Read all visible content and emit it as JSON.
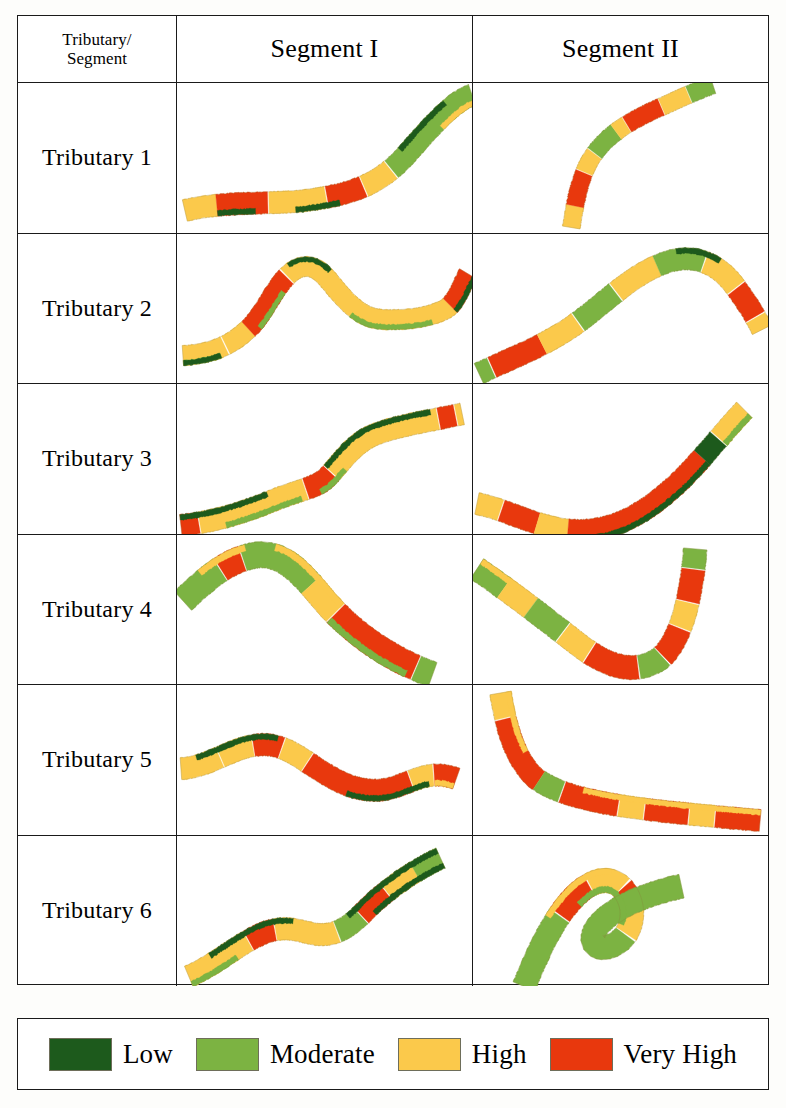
{
  "figure": {
    "type": "stream-condition-matrix",
    "header": {
      "corner_line1": "Tributary/",
      "corner_line2": "Segment",
      "col1": "Segment I",
      "col2": "Segment II"
    },
    "rows": [
      {
        "label": "Tributary 1"
      },
      {
        "label": "Tributary 2"
      },
      {
        "label": "Tributary 3"
      },
      {
        "label": "Tributary 4"
      },
      {
        "label": "Tributary 5"
      },
      {
        "label": "Tributary 6"
      }
    ],
    "legend": {
      "items": [
        {
          "label": "Low",
          "color": "#1d5a1c"
        },
        {
          "label": "Moderate",
          "color": "#7cb342"
        },
        {
          "label": "High",
          "color": "#fbc94b"
        },
        {
          "label": "Very High",
          "color": "#e8380d"
        }
      ]
    },
    "colors": {
      "low": "#1d5a1c",
      "moderate": "#7cb342",
      "high": "#fbc94b",
      "very_high": "#e8380d",
      "outline": "#1a1a1a",
      "paper": "#ffffff"
    }
  },
  "chart_data": {
    "type": "map",
    "title": "",
    "classes": [
      "Low",
      "Moderate",
      "High",
      "Very High"
    ],
    "class_colors": [
      "#1d5a1c",
      "#7cb342",
      "#fbc94b",
      "#e8380d"
    ],
    "rows": [
      "Tributary 1",
      "Tributary 2",
      "Tributary 3",
      "Tributary 4",
      "Tributary 5",
      "Tributary 6"
    ],
    "columns": [
      "Segment I",
      "Segment II"
    ],
    "cells": [
      {
        "row": "Tributary 1",
        "column": "Segment I",
        "path": "M 8 128 C 50 118 95 122 130 118 C 175 112 205 104 235 70 C 262 40 282 18 300 12",
        "width": 22,
        "bands": [
          {
            "start": 0.0,
            "end": 0.1,
            "color": "high"
          },
          {
            "start": 0.1,
            "end": 0.26,
            "color": "very_high"
          },
          {
            "start": 0.26,
            "end": 0.44,
            "color": "high"
          },
          {
            "start": 0.44,
            "end": 0.56,
            "color": "very_high"
          },
          {
            "start": 0.56,
            "end": 0.66,
            "color": "high"
          },
          {
            "start": 0.66,
            "end": 1.0,
            "color": "moderate"
          }
        ],
        "edge_bands": [
          {
            "start": 0.1,
            "end": 0.22,
            "color": "low",
            "side": "lower"
          },
          {
            "start": 0.34,
            "end": 0.48,
            "color": "low",
            "side": "lower"
          },
          {
            "start": 0.72,
            "end": 0.92,
            "color": "low",
            "side": "upper"
          },
          {
            "start": 0.86,
            "end": 1.0,
            "color": "high",
            "side": "lower"
          }
        ]
      },
      {
        "row": "Tributary 1",
        "column": "Segment II",
        "path": "M 100 145 C 104 120 108 96 120 76 C 138 48 168 34 196 22 C 218 12 232 6 244 2",
        "width": 18,
        "bands": [
          {
            "start": 0.0,
            "end": 0.1,
            "color": "high"
          },
          {
            "start": 0.1,
            "end": 0.26,
            "color": "very_high"
          },
          {
            "start": 0.26,
            "end": 0.36,
            "color": "high"
          },
          {
            "start": 0.36,
            "end": 0.5,
            "color": "moderate"
          },
          {
            "start": 0.5,
            "end": 0.56,
            "color": "high"
          },
          {
            "start": 0.56,
            "end": 0.74,
            "color": "very_high"
          },
          {
            "start": 0.74,
            "end": 0.88,
            "color": "high"
          },
          {
            "start": 0.88,
            "end": 1.0,
            "color": "moderate"
          }
        ],
        "edge_bands": []
      },
      {
        "row": "Tributary 2",
        "column": "Segment I",
        "path": "M 6 122 C 36 120 56 112 76 92 C 94 72 104 42 124 34 C 142 28 152 44 164 58 C 180 76 192 86 214 86 C 238 86 254 84 272 76 C 284 70 290 50 296 40",
        "width": 20,
        "bands": [
          {
            "start": 0.0,
            "end": 0.12,
            "color": "high"
          },
          {
            "start": 0.12,
            "end": 0.2,
            "color": "high"
          },
          {
            "start": 0.2,
            "end": 0.38,
            "color": "very_high"
          },
          {
            "start": 0.38,
            "end": 0.9,
            "color": "high"
          },
          {
            "start": 0.9,
            "end": 1.0,
            "color": "very_high"
          }
        ],
        "edge_bands": [
          {
            "start": 0.0,
            "end": 0.1,
            "color": "moderate",
            "side": "lower"
          },
          {
            "start": 0.0,
            "end": 0.1,
            "color": "low",
            "side": "lower"
          },
          {
            "start": 0.22,
            "end": 0.34,
            "color": "moderate",
            "side": "lower"
          },
          {
            "start": 0.4,
            "end": 0.5,
            "color": "low",
            "side": "upper"
          },
          {
            "start": 0.62,
            "end": 0.84,
            "color": "moderate",
            "side": "lower"
          },
          {
            "start": 0.9,
            "end": 1.0,
            "color": "low",
            "side": "lower"
          }
        ]
      },
      {
        "row": "Tributary 2",
        "column": "Segment II",
        "path": "M 6 140 C 40 124 64 116 96 96 C 130 74 156 44 192 30 C 222 18 248 28 266 52 C 280 70 288 84 294 96",
        "width": 22,
        "bands": [
          {
            "start": 0.0,
            "end": 0.04,
            "color": "moderate"
          },
          {
            "start": 0.04,
            "end": 0.2,
            "color": "very_high"
          },
          {
            "start": 0.2,
            "end": 0.32,
            "color": "high"
          },
          {
            "start": 0.32,
            "end": 0.46,
            "color": "moderate"
          },
          {
            "start": 0.46,
            "end": 0.6,
            "color": "high"
          },
          {
            "start": 0.6,
            "end": 0.74,
            "color": "moderate"
          },
          {
            "start": 0.74,
            "end": 0.86,
            "color": "high"
          },
          {
            "start": 0.86,
            "end": 0.96,
            "color": "very_high"
          },
          {
            "start": 0.96,
            "end": 1.0,
            "color": "high"
          }
        ],
        "edge_bands": [
          {
            "start": 0.66,
            "end": 0.78,
            "color": "low",
            "side": "upper"
          }
        ]
      },
      {
        "row": "Tributary 3",
        "column": "Segment I",
        "path": "M 4 142 C 40 138 70 128 100 116 C 126 106 140 104 150 96 C 162 86 176 62 198 52 C 222 42 252 38 290 30",
        "width": 22,
        "bands": [
          {
            "start": 0.0,
            "end": 0.06,
            "color": "very_high"
          },
          {
            "start": 0.06,
            "end": 0.42,
            "color": "high"
          },
          {
            "start": 0.42,
            "end": 0.52,
            "color": "very_high"
          },
          {
            "start": 0.52,
            "end": 0.92,
            "color": "high"
          },
          {
            "start": 0.92,
            "end": 0.98,
            "color": "very_high"
          },
          {
            "start": 0.98,
            "end": 1.0,
            "color": "high"
          }
        ],
        "edge_bands": [
          {
            "start": 0.0,
            "end": 0.3,
            "color": "low",
            "side": "upper"
          },
          {
            "start": 0.14,
            "end": 0.4,
            "color": "moderate",
            "side": "lower"
          },
          {
            "start": 0.46,
            "end": 0.56,
            "color": "moderate",
            "side": "lower"
          },
          {
            "start": 0.52,
            "end": 0.9,
            "color": "low",
            "side": "upper"
          }
        ]
      },
      {
        "row": "Tributary 3",
        "column": "Segment II",
        "path": "M 4 120 C 34 126 56 140 92 146 C 140 152 176 130 212 96 C 240 68 258 44 276 26",
        "width": 22,
        "bands": [
          {
            "start": 0.0,
            "end": 0.08,
            "color": "high"
          },
          {
            "start": 0.08,
            "end": 0.2,
            "color": "very_high"
          },
          {
            "start": 0.2,
            "end": 0.3,
            "color": "high"
          },
          {
            "start": 0.3,
            "end": 0.8,
            "color": "very_high"
          },
          {
            "start": 0.8,
            "end": 0.88,
            "color": "low"
          },
          {
            "start": 0.88,
            "end": 1.0,
            "color": "high"
          }
        ],
        "edge_bands": [
          {
            "start": 0.34,
            "end": 0.8,
            "color": "low",
            "side": "lower"
          },
          {
            "start": 0.88,
            "end": 1.0,
            "color": "moderate",
            "side": "lower"
          }
        ]
      },
      {
        "row": "Tributary 4",
        "column": "Segment I",
        "path": "M 6 66 C 30 44 52 24 82 20 C 110 18 128 40 150 66 C 180 100 216 124 260 140",
        "width": 26,
        "bands": [
          {
            "start": 0.0,
            "end": 0.16,
            "color": "moderate"
          },
          {
            "start": 0.16,
            "end": 0.24,
            "color": "very_high"
          },
          {
            "start": 0.24,
            "end": 0.5,
            "color": "moderate"
          },
          {
            "start": 0.5,
            "end": 0.62,
            "color": "high"
          },
          {
            "start": 0.62,
            "end": 0.94,
            "color": "very_high"
          },
          {
            "start": 0.94,
            "end": 1.0,
            "color": "moderate"
          }
        ],
        "edge_bands": [
          {
            "start": 0.1,
            "end": 0.26,
            "color": "high",
            "side": "upper"
          },
          {
            "start": 0.34,
            "end": 0.62,
            "color": "high",
            "side": "upper"
          },
          {
            "start": 0.62,
            "end": 0.92,
            "color": "moderate",
            "side": "lower"
          }
        ]
      },
      {
        "row": "Tributary 4",
        "column": "Segment II",
        "path": "M 4 34 C 40 58 76 86 110 112 C 140 134 166 140 190 124 C 212 106 222 62 226 14",
        "width": 24,
        "bands": [
          {
            "start": 0.0,
            "end": 0.1,
            "color": "moderate"
          },
          {
            "start": 0.1,
            "end": 0.2,
            "color": "high"
          },
          {
            "start": 0.2,
            "end": 0.32,
            "color": "moderate"
          },
          {
            "start": 0.32,
            "end": 0.42,
            "color": "high"
          },
          {
            "start": 0.42,
            "end": 0.58,
            "color": "very_high"
          },
          {
            "start": 0.58,
            "end": 0.66,
            "color": "moderate"
          },
          {
            "start": 0.66,
            "end": 0.76,
            "color": "very_high"
          },
          {
            "start": 0.76,
            "end": 0.84,
            "color": "high"
          },
          {
            "start": 0.84,
            "end": 0.94,
            "color": "very_high"
          },
          {
            "start": 0.94,
            "end": 1.0,
            "color": "moderate"
          }
        ],
        "edge_bands": [
          {
            "start": 0.0,
            "end": 0.14,
            "color": "high",
            "side": "upper"
          }
        ]
      },
      {
        "row": "Tributary 5",
        "column": "Segment I",
        "path": "M 4 84 C 34 82 56 62 84 60 C 112 58 130 78 156 92 C 180 106 204 110 228 100 C 250 92 262 86 284 94",
        "width": 22,
        "bands": [
          {
            "start": 0.0,
            "end": 0.14,
            "color": "high"
          },
          {
            "start": 0.14,
            "end": 0.26,
            "color": "high"
          },
          {
            "start": 0.26,
            "end": 0.36,
            "color": "very_high"
          },
          {
            "start": 0.36,
            "end": 0.46,
            "color": "high"
          },
          {
            "start": 0.46,
            "end": 0.84,
            "color": "very_high"
          },
          {
            "start": 0.84,
            "end": 0.92,
            "color": "high"
          },
          {
            "start": 0.92,
            "end": 1.0,
            "color": "very_high"
          }
        ],
        "edge_bands": [
          {
            "start": 0.06,
            "end": 0.34,
            "color": "low",
            "side": "upper"
          },
          {
            "start": 0.62,
            "end": 0.9,
            "color": "low",
            "side": "lower"
          },
          {
            "start": 0.92,
            "end": 1.0,
            "color": "high",
            "side": "lower"
          }
        ]
      },
      {
        "row": "Tributary 5",
        "column": "Segment II",
        "path": "M 28 8 C 34 44 42 72 62 92 C 96 120 180 126 292 136",
        "width": 22,
        "bands": [
          {
            "start": 0.0,
            "end": 0.08,
            "color": "high"
          },
          {
            "start": 0.08,
            "end": 0.3,
            "color": "very_high"
          },
          {
            "start": 0.3,
            "end": 0.38,
            "color": "moderate"
          },
          {
            "start": 0.38,
            "end": 0.56,
            "color": "very_high"
          },
          {
            "start": 0.56,
            "end": 0.64,
            "color": "high"
          },
          {
            "start": 0.64,
            "end": 0.78,
            "color": "very_high"
          },
          {
            "start": 0.78,
            "end": 0.86,
            "color": "high"
          },
          {
            "start": 0.86,
            "end": 1.0,
            "color": "very_high"
          }
        ],
        "edge_bands": [
          {
            "start": 0.0,
            "end": 0.2,
            "color": "high",
            "side": "upper"
          },
          {
            "start": 0.44,
            "end": 1.0,
            "color": "high",
            "side": "upper"
          }
        ]
      },
      {
        "row": "Tributary 6",
        "column": "Segment I",
        "path": "M 12 140 C 40 128 64 106 90 96 C 114 88 126 96 142 98 C 160 100 174 92 190 76 C 212 54 238 36 268 22",
        "width": 22,
        "bands": [
          {
            "start": 0.0,
            "end": 0.24,
            "color": "high"
          },
          {
            "start": 0.24,
            "end": 0.34,
            "color": "very_high"
          },
          {
            "start": 0.34,
            "end": 0.56,
            "color": "high"
          },
          {
            "start": 0.56,
            "end": 0.66,
            "color": "moderate"
          },
          {
            "start": 0.66,
            "end": 0.78,
            "color": "very_high"
          },
          {
            "start": 0.78,
            "end": 0.9,
            "color": "high"
          },
          {
            "start": 0.9,
            "end": 1.0,
            "color": "moderate"
          }
        ],
        "edge_bands": [
          {
            "start": 0.0,
            "end": 0.18,
            "color": "moderate",
            "side": "lower"
          },
          {
            "start": 0.1,
            "end": 0.4,
            "color": "low",
            "side": "upper"
          },
          {
            "start": 0.62,
            "end": 1.0,
            "color": "low",
            "side": "upper"
          },
          {
            "start": 0.7,
            "end": 1.0,
            "color": "low",
            "side": "lower"
          }
        ]
      },
      {
        "row": "Tributary 6",
        "column": "Segment II",
        "path": "M 52 150 C 66 116 80 86 100 64 C 118 44 138 38 152 52 C 166 68 164 92 150 104 C 132 118 116 110 124 94 C 138 72 176 58 212 50",
        "width": 24,
        "bands": [
          {
            "start": 0.0,
            "end": 0.22,
            "color": "moderate"
          },
          {
            "start": 0.22,
            "end": 0.34,
            "color": "very_high"
          },
          {
            "start": 0.34,
            "end": 0.44,
            "color": "high"
          },
          {
            "start": 0.44,
            "end": 0.5,
            "color": "very_high"
          },
          {
            "start": 0.5,
            "end": 0.58,
            "color": "high"
          },
          {
            "start": 0.58,
            "end": 1.0,
            "color": "moderate"
          }
        ],
        "edge_bands": [
          {
            "start": 0.2,
            "end": 0.4,
            "color": "high",
            "side": "upper"
          },
          {
            "start": 0.28,
            "end": 0.56,
            "color": "moderate",
            "side": "lower"
          }
        ]
      }
    ]
  }
}
